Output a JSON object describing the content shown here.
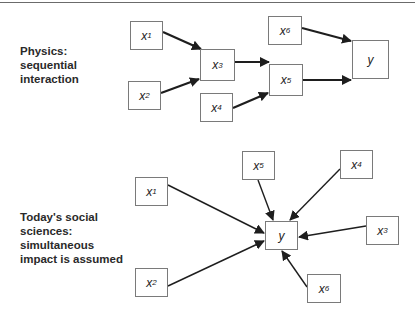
{
  "panels": [
    {
      "id": "physics",
      "label": "Physics:\nsequential\ninteraction",
      "label_pos": [
        20,
        44
      ],
      "edge_width": 2.2,
      "nodes": [
        {
          "id": "x1",
          "var": "x",
          "sub": "1",
          "box": [
            130,
            21,
            33,
            29
          ]
        },
        {
          "id": "x2",
          "var": "x",
          "sub": "2",
          "box": [
            128,
            81,
            33,
            29
          ]
        },
        {
          "id": "x3",
          "var": "x",
          "sub": "3",
          "box": [
            200,
            49,
            35,
            32
          ]
        },
        {
          "id": "x4",
          "var": "x",
          "sub": "4",
          "box": [
            200,
            93,
            33,
            29
          ]
        },
        {
          "id": "x5",
          "var": "x",
          "sub": "5",
          "box": [
            269,
            64,
            34,
            32
          ]
        },
        {
          "id": "x6",
          "var": "x",
          "sub": "6",
          "box": [
            268,
            16,
            34,
            29
          ]
        },
        {
          "id": "y",
          "var": "y",
          "sub": "",
          "box": [
            352,
            40,
            37,
            39
          ]
        }
      ],
      "edges": [
        {
          "from": "x1",
          "to": "x3",
          "pts": [
            163,
            32,
            201,
            49
          ]
        },
        {
          "from": "x2",
          "to": "x3",
          "pts": [
            161,
            93,
            199,
            79
          ]
        },
        {
          "from": "x3",
          "to": "x5",
          "pts": [
            235,
            62,
            269,
            62
          ]
        },
        {
          "from": "x4",
          "to": "x5",
          "pts": [
            233,
            108,
            268,
            93
          ]
        },
        {
          "from": "x6",
          "to": "y",
          "pts": [
            302,
            28,
            351,
            41
          ]
        },
        {
          "from": "x5",
          "to": "y",
          "pts": [
            303,
            80,
            351,
            80
          ]
        }
      ]
    },
    {
      "id": "social",
      "label": "Today's social\nsciences:\nsimultaneous\nimpact is assumed",
      "label_pos": [
        20,
        210
      ],
      "edge_width": 1.4,
      "nodes": [
        {
          "id": "x1",
          "var": "x",
          "sub": "1",
          "box": [
            135,
            177,
            33,
            29
          ]
        },
        {
          "id": "x2",
          "var": "x",
          "sub": "2",
          "box": [
            135,
            268,
            33,
            29
          ]
        },
        {
          "id": "x5",
          "var": "x",
          "sub": "5",
          "box": [
            242,
            151,
            33,
            29
          ]
        },
        {
          "id": "x4",
          "var": "x",
          "sub": "4",
          "box": [
            340,
            150,
            33,
            29
          ]
        },
        {
          "id": "y",
          "var": "y",
          "sub": "",
          "box": [
            265,
            221,
            33,
            29
          ]
        },
        {
          "id": "x3",
          "var": "x",
          "sub": "3",
          "box": [
            366,
            216,
            33,
            29
          ]
        },
        {
          "id": "x6",
          "var": "x",
          "sub": "6",
          "box": [
            307,
            274,
            34,
            29
          ]
        }
      ],
      "edges": [
        {
          "from": "x1",
          "to": "y",
          "pts": [
            168,
            185,
            264,
            233
          ]
        },
        {
          "from": "x2",
          "to": "y",
          "pts": [
            168,
            286,
            264,
            241
          ]
        },
        {
          "from": "x5",
          "to": "y",
          "pts": [
            258,
            180,
            273,
            220
          ]
        },
        {
          "from": "x4",
          "to": "y",
          "pts": [
            340,
            169,
            290,
            220
          ]
        },
        {
          "from": "x3",
          "to": "y",
          "pts": [
            366,
            226,
            299,
            237
          ]
        },
        {
          "from": "x6",
          "to": "y",
          "pts": [
            307,
            287,
            282,
            251
          ]
        }
      ]
    }
  ],
  "colors": {
    "edge": "#1e1e1e",
    "box_border": "#7a7a7a",
    "text": "#2a2a2a",
    "rule": "#6b6b6b"
  }
}
